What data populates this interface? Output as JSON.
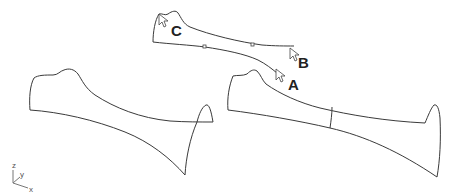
{
  "diagram": {
    "type": "3d-curve-surface-construction",
    "labels": {
      "a": "A",
      "b": "B",
      "c": "C"
    },
    "axes": {
      "x": "x",
      "y": "y",
      "z": "z"
    },
    "shapes": [
      {
        "name": "top-curve-network",
        "description": "two boundary curves with control points and cursors A, B, C"
      },
      {
        "name": "left-surface-outline",
        "description": "lofted outline of bone-like shape"
      },
      {
        "name": "right-surface-outline",
        "description": "lofted outline with vertical seam"
      }
    ],
    "colors": {
      "stroke": "#3a3a3a",
      "background": "#ffffff"
    }
  }
}
